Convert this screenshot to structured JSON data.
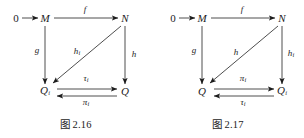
{
  "page": {
    "background_color": "#ffffff",
    "ink_color": "#1c1c1c",
    "width": 304,
    "height": 138
  },
  "figures": [
    {
      "id": "figure-2-16",
      "caption_prefix": "图",
      "caption_number": "2.16",
      "nodes": [
        {
          "name": "zero",
          "label": "0",
          "subscript": "",
          "x": 16,
          "y": 18
        },
        {
          "name": "m",
          "label": "M",
          "subscript": "",
          "x": 45,
          "y": 18
        },
        {
          "name": "n",
          "label": "N",
          "subscript": "",
          "x": 125,
          "y": 18
        },
        {
          "name": "q-sub-i",
          "label": "Q",
          "subscript": "i",
          "x": 45,
          "y": 91
        },
        {
          "name": "q",
          "label": "Q",
          "subscript": "",
          "x": 125,
          "y": 91
        }
      ],
      "edges": [
        {
          "name": "zero-to-m",
          "label": "",
          "subscript": "",
          "direction": "right"
        },
        {
          "name": "m-to-n",
          "label": "f",
          "subscript": "",
          "direction": "right",
          "label_x": 85,
          "label_y": 9
        },
        {
          "name": "m-to-qi",
          "label": "g",
          "subscript": "",
          "direction": "down",
          "label_x": 37,
          "label_y": 50
        },
        {
          "name": "n-to-q",
          "label": "h",
          "subscript": "",
          "direction": "down",
          "label_x": 134,
          "label_y": 54
        },
        {
          "name": "n-to-qi",
          "label": "h",
          "subscript": "i",
          "direction": "diagonal-down-left",
          "label_x": 77,
          "label_y": 52
        },
        {
          "name": "qi-to-q",
          "label": "τ",
          "subscript": "i",
          "direction": "right",
          "label_x": 86,
          "label_y": 79
        },
        {
          "name": "q-to-qi",
          "label": "π",
          "subscript": "i",
          "direction": "left",
          "label_x": 86,
          "label_y": 103
        }
      ]
    },
    {
      "id": "figure-2-17",
      "caption_prefix": "图",
      "caption_number": "2.17",
      "nodes": [
        {
          "name": "zero",
          "label": "0",
          "subscript": "",
          "x": 21,
          "y": 18
        },
        {
          "name": "m",
          "label": "M",
          "subscript": "",
          "x": 50,
          "y": 18
        },
        {
          "name": "n",
          "label": "N",
          "subscript": "",
          "x": 130,
          "y": 18
        },
        {
          "name": "q",
          "label": "Q",
          "subscript": "",
          "x": 50,
          "y": 91
        },
        {
          "name": "q-sub-i",
          "label": "Q",
          "subscript": "i",
          "x": 130,
          "y": 91
        }
      ],
      "edges": [
        {
          "name": "zero-to-m",
          "label": "",
          "subscript": "",
          "direction": "right"
        },
        {
          "name": "m-to-n",
          "label": "f",
          "subscript": "",
          "direction": "right",
          "label_x": 90,
          "label_y": 9
        },
        {
          "name": "m-to-q",
          "label": "g",
          "subscript": "",
          "direction": "down",
          "label_x": 42,
          "label_y": 50
        },
        {
          "name": "n-to-qi",
          "label": "h",
          "subscript": "i",
          "direction": "down",
          "label_x": 139,
          "label_y": 54
        },
        {
          "name": "n-to-q",
          "label": "h",
          "subscript": "",
          "direction": "diagonal-down-left",
          "label_x": 84,
          "label_y": 52
        },
        {
          "name": "q-to-qi",
          "label": "π",
          "subscript": "i",
          "direction": "right",
          "label_x": 91,
          "label_y": 79
        },
        {
          "name": "qi-to-q",
          "label": "τ",
          "subscript": "i",
          "direction": "left",
          "label_x": 91,
          "label_y": 103
        }
      ]
    }
  ]
}
